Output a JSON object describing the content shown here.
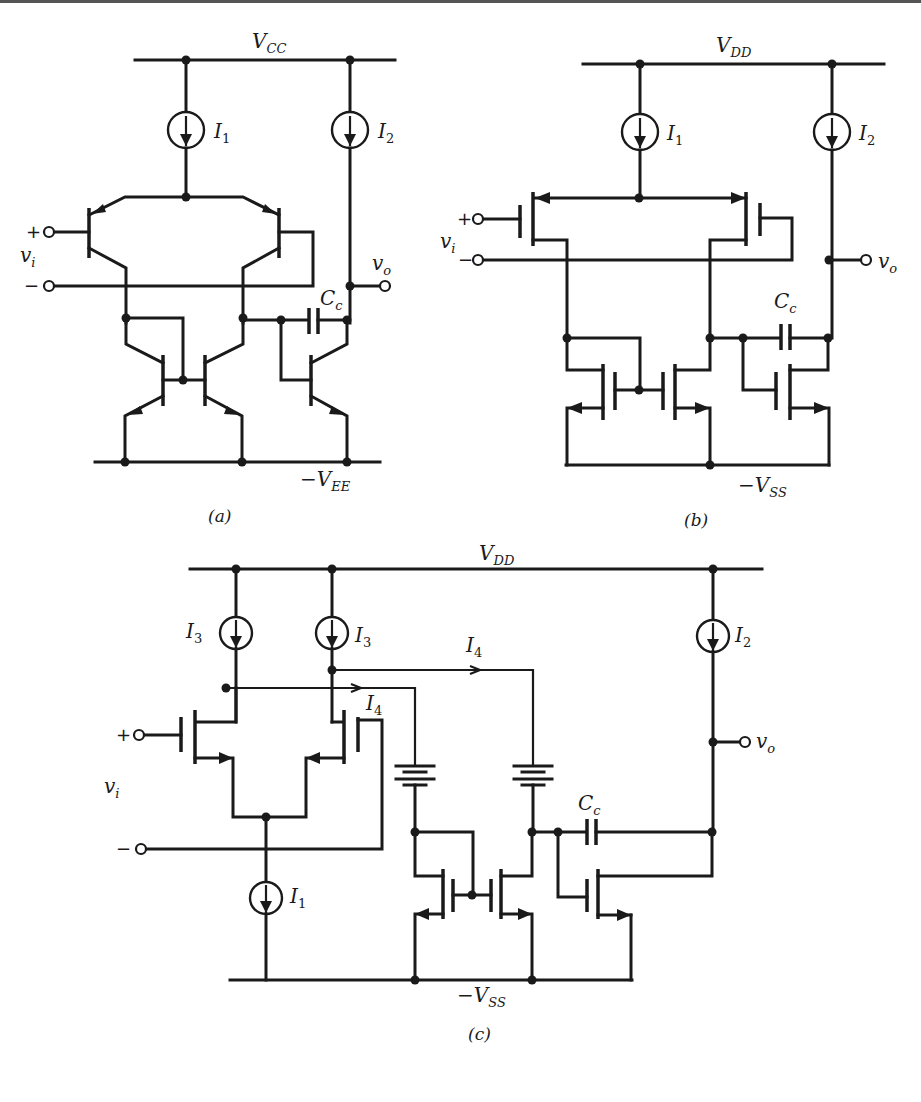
{
  "figure": {
    "panels": [
      {
        "id": "a",
        "caption": "(a)",
        "technology": "BJT",
        "supply_top": {
          "main": "V",
          "sub": "CC"
        },
        "supply_bottom": {
          "main": "−V",
          "sub": "EE"
        },
        "sources": [
          {
            "main": "I",
            "sub": "1"
          },
          {
            "main": "I",
            "sub": "2"
          }
        ],
        "input_label": {
          "main": "v",
          "sub": "i"
        },
        "input_plus": "+",
        "input_minus": "−",
        "output_label": {
          "main": "v",
          "sub": "o"
        },
        "cap_label": {
          "main": "C",
          "sub": "c"
        }
      },
      {
        "id": "b",
        "caption": "(b)",
        "technology": "MOSFET",
        "supply_top": {
          "main": "V",
          "sub": "DD"
        },
        "supply_bottom": {
          "main": "−V",
          "sub": "SS"
        },
        "sources": [
          {
            "main": "I",
            "sub": "1"
          },
          {
            "main": "I",
            "sub": "2"
          }
        ],
        "input_label": {
          "main": "v",
          "sub": "i"
        },
        "input_plus": "+",
        "input_minus": "−",
        "output_label": {
          "main": "v",
          "sub": "o"
        },
        "cap_label": {
          "main": "C",
          "sub": "c"
        }
      },
      {
        "id": "c",
        "caption": "(c)",
        "technology": "MOSFET folded with level-shift batteries",
        "supply_top": {
          "main": "V",
          "sub": "DD"
        },
        "supply_bottom": {
          "main": "−V",
          "sub": "SS"
        },
        "sources": [
          {
            "main": "I",
            "sub": "3"
          },
          {
            "main": "I",
            "sub": "3"
          },
          {
            "main": "I",
            "sub": "2"
          },
          {
            "main": "I",
            "sub": "1"
          }
        ],
        "branch_currents": [
          {
            "main": "I",
            "sub": "4"
          },
          {
            "main": "I",
            "sub": "4"
          }
        ],
        "input_label": {
          "main": "v",
          "sub": "i"
        },
        "input_plus": "+",
        "input_minus": "−",
        "output_label": {
          "main": "v",
          "sub": "o"
        },
        "cap_label": {
          "main": "C",
          "sub": "c"
        }
      }
    ]
  }
}
